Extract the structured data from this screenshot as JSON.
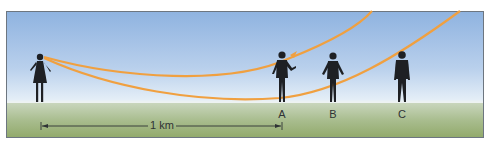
{
  "diagram": {
    "observer": "woman-observer",
    "people": [
      {
        "label": "A",
        "x": 282
      },
      {
        "label": "B",
        "x": 333
      },
      {
        "label": "C",
        "x": 402
      }
    ],
    "scale_bar": {
      "label": "1 km"
    },
    "colors": {
      "sky_top": "#8fb3e0",
      "sky_bottom": "#e4eef7",
      "ground": "#a9bd8f",
      "ray": "#f0a040",
      "silhouette": "#1e2024",
      "frame_border": "#6d7680"
    }
  }
}
